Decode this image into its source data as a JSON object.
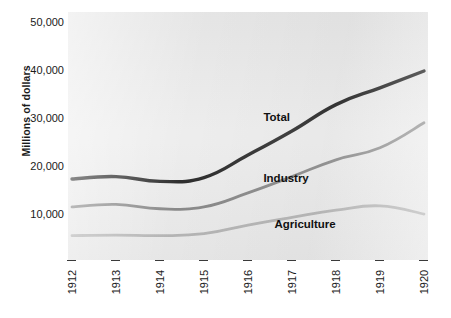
{
  "chart_data": {
    "type": "line",
    "title": "",
    "xlabel": "",
    "ylabel": "Millions of dollars",
    "x": [
      1912,
      1913,
      1914,
      1915,
      1916,
      1917,
      1918,
      1919,
      1920
    ],
    "x_tick_labels": [
      "1912",
      "1913",
      "1914",
      "1915",
      "1916",
      "1917",
      "1918",
      "1919",
      "1920"
    ],
    "y_tick_labels": [
      "50,000",
      "40,000",
      "30,000",
      "20,000",
      "10,000"
    ],
    "y_ticks": [
      50000,
      40000,
      30000,
      20000,
      10000
    ],
    "ylim": [
      3000,
      51000
    ],
    "xlim": [
      1912,
      1920
    ],
    "grid": false,
    "legend_position": "inline-annotations",
    "plot_background": "#e9e9e9",
    "series": [
      {
        "name": "Total",
        "color": "#111111",
        "values": [
          17500,
          18000,
          17000,
          17800,
          22500,
          27500,
          33000,
          36500,
          40000
        ],
        "label_x": 1916.35,
        "label_y": 30200
      },
      {
        "name": "Industry",
        "color": "#808080",
        "values": [
          11700,
          12200,
          11300,
          11700,
          14600,
          18000,
          21500,
          24000,
          29200
        ],
        "label_x": 1916.35,
        "label_y": 17600
      },
      {
        "name": "Agriculture",
        "color": "#b3b3b3",
        "values": [
          5700,
          5800,
          5700,
          6100,
          7900,
          9500,
          11000,
          11900,
          10200
        ],
        "label_x": 1916.6,
        "label_y": 8000
      }
    ]
  }
}
